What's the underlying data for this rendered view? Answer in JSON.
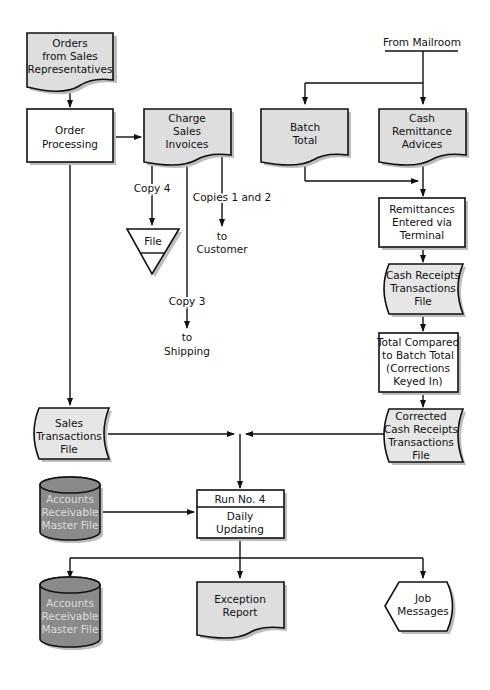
{
  "diagram": {
    "type": "system flowchart",
    "colors": {
      "document_fill": "#dedede",
      "process_fill": "#ffffff",
      "online_file_fill": "#e6e6e6",
      "disk_fill": "#8a8a8a",
      "disk_text": "#dcdcdc",
      "stroke": "#111111"
    },
    "nodes": {
      "orders": {
        "shape": "document",
        "lines": [
          "Orders",
          "from Sales",
          "Representatives"
        ]
      },
      "order_processing": {
        "shape": "process",
        "lines": [
          "Order",
          "Processing"
        ]
      },
      "charge_invoices": {
        "shape": "document",
        "lines": [
          "Charge",
          "Sales",
          "Invoices"
        ]
      },
      "file": {
        "shape": "offline-storage",
        "lines": [
          "File"
        ]
      },
      "from_mailroom": {
        "shape": "label",
        "lines": [
          "From Mailroom"
        ]
      },
      "batch_total": {
        "shape": "document",
        "lines": [
          "Batch",
          "Total"
        ]
      },
      "cash_remittance": {
        "shape": "document",
        "lines": [
          "Cash",
          "Remittance",
          "Advices"
        ]
      },
      "remittances_entered": {
        "shape": "process",
        "lines": [
          "Remittances",
          "Entered via",
          "Terminal"
        ]
      },
      "cash_receipts_file": {
        "shape": "online-storage",
        "lines": [
          "Cash Receipts",
          "Transactions",
          "File"
        ]
      },
      "total_compared": {
        "shape": "process",
        "lines": [
          "Total Compared",
          "to Batch Total",
          "(Corrections",
          "Keyed In)"
        ]
      },
      "corrected_file": {
        "shape": "online-storage",
        "lines": [
          "Corrected",
          "Cash Receipts",
          "Transactions",
          "File"
        ]
      },
      "sales_file": {
        "shape": "online-storage",
        "lines": [
          "Sales",
          "Transactions",
          "File"
        ]
      },
      "ar_master_in": {
        "shape": "disk",
        "lines": [
          "Accounts",
          "Receivable",
          "Master File"
        ]
      },
      "run": {
        "shape": "process",
        "header": "Run No. 4",
        "lines": [
          "Daily",
          "Updating"
        ]
      },
      "ar_master_out": {
        "shape": "disk",
        "lines": [
          "Accounts",
          "Receivable",
          "Master File"
        ]
      },
      "exception_report": {
        "shape": "document",
        "lines": [
          "Exception",
          "Report"
        ]
      },
      "job_messages": {
        "shape": "display",
        "lines": [
          "Job",
          "Messages"
        ]
      }
    },
    "edge_labels": {
      "copy4": "Copy 4",
      "copies12": "Copies 1 and 2",
      "to_customer": [
        "to",
        "Customer"
      ],
      "copy3": "Copy 3",
      "to_shipping": [
        "to",
        "Shipping"
      ]
    }
  }
}
